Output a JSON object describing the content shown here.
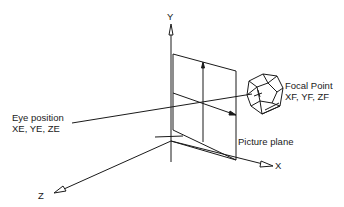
{
  "diagram": {
    "axes": {
      "y_label": "Y",
      "x_label": "X",
      "z_label": "Z"
    },
    "labels": {
      "focal_point_title": "Focal Point",
      "focal_point_coords": "XF, YF, ZF",
      "eye_position_title": "Eye position",
      "eye_position_coords": "XE, YE, ZE",
      "picture_plane": "Picture plane"
    },
    "colors": {
      "line": "#1a1a1a",
      "background": "#ffffff"
    }
  }
}
